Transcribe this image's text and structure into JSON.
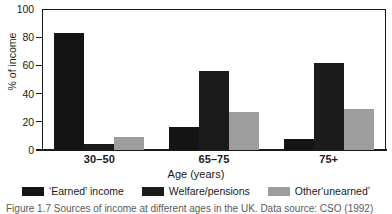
{
  "chart_data": {
    "type": "bar",
    "title": "",
    "xlabel": "Age (years)",
    "ylabel": "% of income",
    "categories": [
      "30–50",
      "65–75",
      "75+"
    ],
    "series": [
      {
        "name": "‘Earned’ income",
        "values": [
          83,
          16,
          8
        ],
        "color": "#141414"
      },
      {
        "name": "Welfare/pensions",
        "values": [
          4,
          56,
          62
        ],
        "color": "#1b1b1b"
      },
      {
        "name": "Other‘unearned’",
        "values": [
          9,
          27,
          29
        ],
        "color": "#9d9d9d"
      }
    ],
    "ylim": [
      0,
      100
    ],
    "yticks": [
      0,
      20,
      40,
      60,
      80,
      100
    ],
    "ytick_labels": [
      "0",
      "20",
      "40",
      "60",
      "80",
      "100"
    ],
    "grid": false,
    "legend_position": "bottom"
  },
  "caption": {
    "text": "Figure 1.7 Sources of income at different ages in the UK. Data source: CSO (1992)"
  }
}
